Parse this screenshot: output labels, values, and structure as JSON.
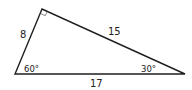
{
  "figure": {
    "type": "right-triangle",
    "colors": {
      "line": "#1f1f1f",
      "text": "#222222",
      "background": "#ffffff"
    },
    "vertices": {
      "top": [
        42,
        9
      ],
      "bottom_left": [
        15,
        74
      ],
      "bottom_right": [
        185,
        74
      ]
    },
    "right_angle_marker": {
      "at": "top"
    },
    "sides": {
      "left": {
        "label": "8"
      },
      "hypotenuse": {
        "label": "17"
      },
      "right_top": {
        "label": "15"
      }
    },
    "angles": {
      "bottom_left": {
        "label": "60°"
      },
      "bottom_right": {
        "label": "30°"
      }
    }
  }
}
